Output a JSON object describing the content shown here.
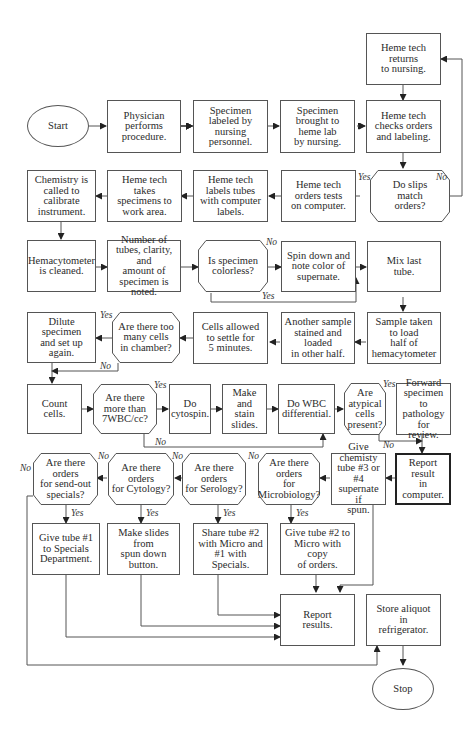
{
  "diagram": {
    "type": "flowchart",
    "nodes": {
      "start": "Start",
      "physician": "Physician\nperforms\nprocedure.",
      "labeled": "Specimen\nlabeled by\nnursing\npersonnel.",
      "brought": "Specimen\nbrought to\nheme lab\nby nursing.",
      "returns": "Heme tech\nreturns\nto nursing.",
      "checks": "Heme tech\nchecks orders\nand labeling.",
      "slips": "Do slips\nmatch\norders?",
      "orders_tests": "Heme tech\norders tests\non computer.",
      "labels_tubes": "Heme tech\nlabels tubes\nwith computer\nlabels.",
      "takes": "Heme tech\ntakes\nspecimens to\nwork area.",
      "chemistry": "Chemistry is\ncalled to\ncalibrate\ninstrument.",
      "hemacytometer": "Hemacytometer\nis cleaned.",
      "number": "Number of\ntubes, clarity, and\namount of\nspecimen is noted.",
      "colorless": "Is specimen\ncolorless?",
      "spin": "Spin down and\nnote color of\nsupernate.",
      "mix": "Mix last\ntube.",
      "sample": "Sample taken\nto load\nhalf of\nhemacytometer",
      "another": "Another sample\nstained and loaded\nin other half.",
      "settle": "Cells allowed\nto settle for\n5 minutes.",
      "too_many": "Are there too\nmany cells\nin chamber?",
      "dilute": "Dilute specimen\nand set up\nagain.",
      "count": "Count\ncells.",
      "more7": "Are there\nmore than\n7WBC/cc?",
      "cytospin": "Do\ncytospin.",
      "make_stain": "Make and\nstain slides.",
      "wbc_diff": "Do WBC\ndifferential.",
      "atypical": "Are\natypical\ncells\npresent?",
      "forward": "Forward\nspecimen to\npathology for\nreview.",
      "report_computer": "Report result\nin computer.",
      "give_chem": "Give chemisty\ntube #3 or #4\nsupernate if\nspun.",
      "q_micro": "Are there orders\nfor\nMicrobiology?",
      "q_sero": "Are there orders\nfor Serology?",
      "q_cyto": "Are there orders\nfor Cytology?",
      "q_sendout": "Are there orders\nfor send-out\nspecials?",
      "give1": "Give tube #1\nto Specials\nDepartment.",
      "make_slides": "Make slides from\nspun down\nbutton.",
      "share2": "Share tube #2\nwith Micro and\n#1 with Specials.",
      "give2": "Give tube #2 to\nMicro with copy\nof orders.",
      "report_results": "Report\nresults.",
      "store": "Store aliquot\nin\nrefrigerator.",
      "stop": "Stop"
    },
    "labels": {
      "yes": "Yes",
      "no": "No"
    }
  }
}
